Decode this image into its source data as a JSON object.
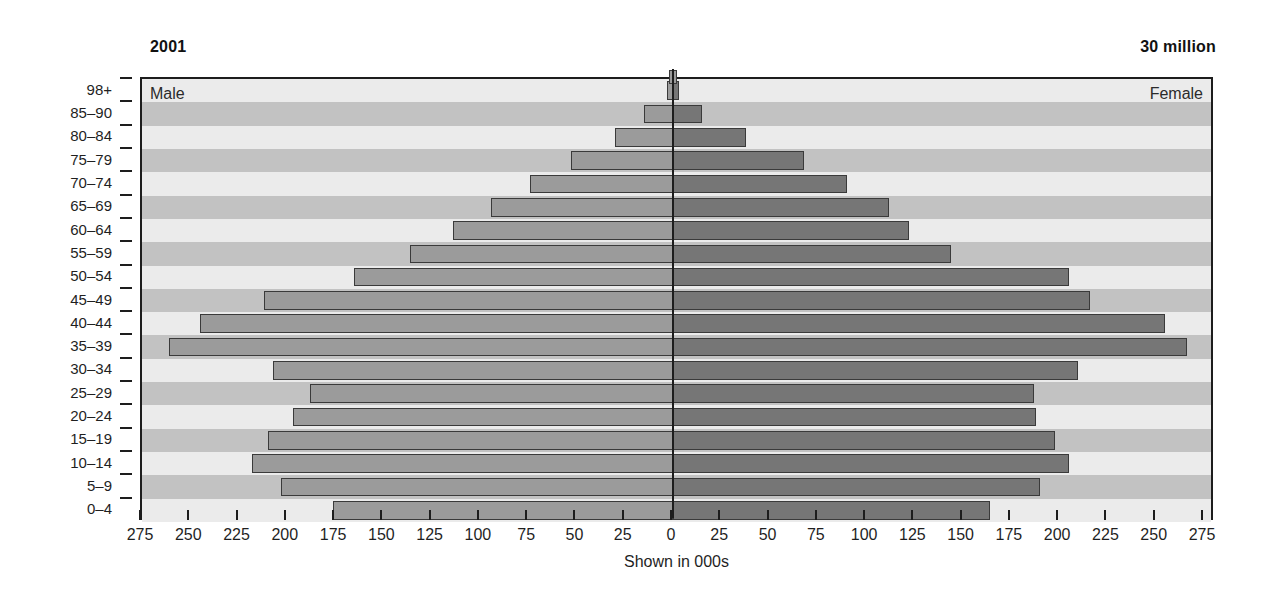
{
  "header": {
    "year_label": "2001",
    "total_label": "30 million"
  },
  "plot": {
    "male_caption": "Male",
    "female_caption": "Female",
    "x_axis_title": "Shown in 000s",
    "x_tick_labels": [
      "275",
      "250",
      "225",
      "200",
      "175",
      "150",
      "125",
      "100",
      "75",
      "50",
      "25",
      "0",
      "25",
      "50",
      "75",
      "100",
      "125",
      "150",
      "175",
      "200",
      "225",
      "250",
      "275"
    ]
  },
  "colors": {
    "male_bar": "#9b9b9b",
    "female_bar": "#767676",
    "band_dark": "#c2c2c2",
    "band_light": "#ebebeb",
    "outline": "#3a3a3a",
    "axis": "#1d1d1d"
  },
  "chart_data": {
    "type": "bar",
    "subtype": "population-pyramid",
    "title": "2001",
    "annotation": "30 million",
    "xlabel": "Shown in 000s",
    "ylabel": "",
    "xlim": [
      -275,
      275
    ],
    "x_ticks": [
      -275,
      -250,
      -225,
      -200,
      -175,
      -150,
      -125,
      -100,
      -75,
      -50,
      -25,
      0,
      25,
      50,
      75,
      100,
      125,
      150,
      175,
      200,
      225,
      250,
      275
    ],
    "x_tick_labels": [
      "275",
      "250",
      "225",
      "200",
      "175",
      "150",
      "125",
      "100",
      "75",
      "50",
      "25",
      "0",
      "25",
      "50",
      "75",
      "100",
      "125",
      "150",
      "175",
      "200",
      "225",
      "250",
      "275"
    ],
    "grid": false,
    "legend_position": "in-plot-corners",
    "categories": [
      "98+",
      "85-90",
      "80-84",
      "75-79",
      "70-74",
      "65-69",
      "60-64",
      "55-59",
      "50-54",
      "45-49",
      "40-44",
      "35-39",
      "30-34",
      "25-29",
      "20-24",
      "15-19",
      "10-14",
      "5-9",
      "0-4"
    ],
    "series": [
      {
        "name": "Male",
        "side": "left",
        "color": "#9b9b9b",
        "values": [
          3,
          15,
          30,
          53,
          74,
          94,
          114,
          136,
          165,
          212,
          245,
          261,
          207,
          188,
          197,
          210,
          218,
          203,
          176
        ]
      },
      {
        "name": "Female",
        "side": "right",
        "color": "#767676",
        "values": [
          3,
          15,
          38,
          68,
          90,
          112,
          122,
          144,
          205,
          216,
          255,
          266,
          210,
          187,
          188,
          198,
          205,
          190,
          164
        ]
      }
    ]
  }
}
